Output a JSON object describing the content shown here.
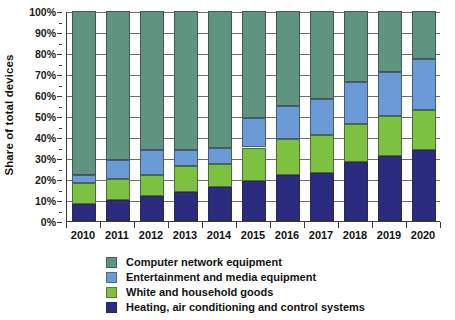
{
  "chart_data": {
    "type": "bar",
    "subtype": "stacked-bar-100-percent",
    "title": "",
    "xlabel": "",
    "ylabel": "Share of total devices",
    "ylim": [
      0,
      100
    ],
    "y_unit": "%",
    "grid": true,
    "legend_position": "bottom",
    "categories": [
      "2010",
      "2011",
      "2012",
      "2013",
      "2014",
      "2015",
      "2016",
      "2017",
      "2018",
      "2019",
      "2020"
    ],
    "y_ticks": [
      "0%",
      "10%",
      "20%",
      "30%",
      "40%",
      "50%",
      "60%",
      "70%",
      "80%",
      "90%",
      "100%"
    ],
    "y_tick_values": [
      0,
      10,
      20,
      30,
      40,
      50,
      60,
      70,
      80,
      90,
      100
    ],
    "series": [
      {
        "name": "Heating, air conditioning and control systems",
        "color": "#2b2b80",
        "values": [
          8,
          10,
          12,
          14,
          16,
          19,
          22,
          23,
          28,
          31,
          34
        ]
      },
      {
        "name": "White and household goods",
        "color": "#7dc143",
        "values": [
          10,
          10,
          10,
          12,
          11,
          16,
          17,
          18,
          18,
          19,
          19
        ]
      },
      {
        "name": "Entertainment and media equipment",
        "color": "#6b9bd6",
        "values": [
          4,
          9,
          12,
          8,
          8,
          14,
          16,
          17,
          20,
          21,
          24
        ]
      },
      {
        "name": "Computer network equipment",
        "color": "#5f9480",
        "values": [
          78,
          71,
          66,
          66,
          65,
          51,
          45,
          42,
          34,
          29,
          23
        ]
      }
    ],
    "legend_order": [
      "Computer network equipment",
      "Entertainment and media equipment",
      "White and household goods",
      "Heating, air conditioning and control systems"
    ]
  },
  "axis": {
    "y_title": "Share of total devices"
  },
  "colors": {
    "network": "#5f9480",
    "entertainment": "#6b9bd6",
    "white_goods": "#7dc143",
    "heating": "#2b2b80",
    "axis": "#3a3a3a",
    "grid": "#6e6e6e",
    "text": "#111111",
    "background": "#ffffff"
  }
}
